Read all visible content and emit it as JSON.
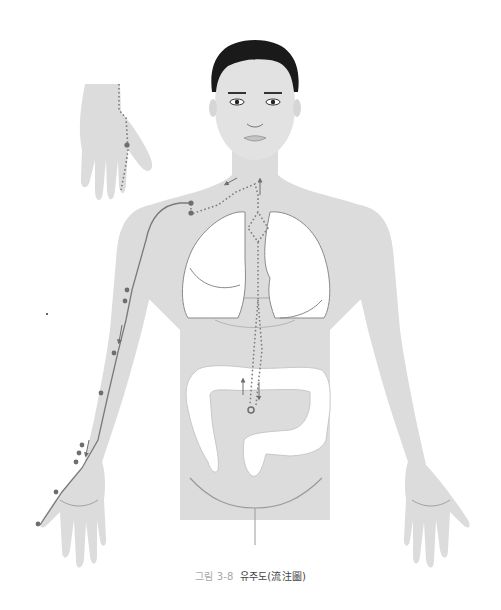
{
  "figure": {
    "type": "anatomical meridian flow diagram",
    "caption": {
      "label": "그림 3-8",
      "title": "유주도(流注圖)"
    },
    "colors": {
      "skin": "#dcdcdc",
      "organ": "#ffffff",
      "outline": "#8a8a8a",
      "path": "#7a7a7a",
      "point": "#6e6e6e",
      "hair": "#1a1a1a"
    },
    "elements": {
      "body": "front-view male torso with arms",
      "inset": "back of hand (dorsal view) with dotted path and point",
      "organs": [
        "left lung",
        "right lung",
        "large intestine (colon)"
      ],
      "paths": [
        "solid line along lateral arm from shoulder to thumb",
        "dotted line from shoulder across clavicle to neck",
        "dotted line descending midline through lungs to colon",
        "dotted diamond at upper chest"
      ],
      "arrows": [
        "down along arm",
        "down along forearm",
        "left at neck",
        "up at neck",
        "up at colon",
        "down at colon"
      ]
    }
  }
}
